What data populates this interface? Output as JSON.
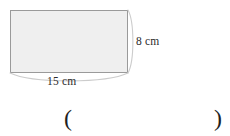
{
  "figure": {
    "type": "rectangle-with-brace-dimensions",
    "background_color": "#ffffff",
    "shape": {
      "name": "rectangle",
      "fill_color": "#efefef",
      "stroke_color": "#9a9a9a",
      "x": 10,
      "y": 10,
      "width": 118,
      "height": 63
    },
    "braces": {
      "stroke_color": "#c9c9c9",
      "right": {
        "name": "height-brace",
        "orientation": "vertical",
        "from_x": 128,
        "from_y": 10,
        "to_x": 128,
        "to_y": 73,
        "apex_x": 134
      },
      "bottom": {
        "name": "width-brace",
        "orientation": "horizontal",
        "from_x": 10,
        "from_y": 73,
        "to_x": 128,
        "to_y": 73,
        "apex_y": 82
      }
    },
    "labels": {
      "height": "8 cm",
      "width": "15 cm"
    }
  },
  "answer_blank": {
    "open_paren": "(",
    "close_paren": ")",
    "value": ""
  }
}
